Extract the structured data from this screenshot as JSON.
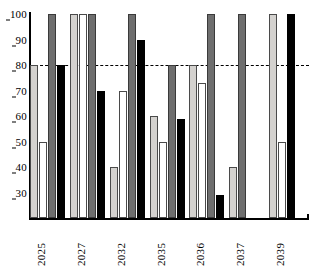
{
  "chart_data": {
    "type": "bar",
    "title": "",
    "xlabel": "",
    "ylabel": "",
    "ylim": [
      20,
      100
    ],
    "yticks": [
      20,
      30,
      40,
      50,
      60,
      70,
      80,
      90,
      100
    ],
    "grid": false,
    "legend": "none",
    "categories": [
      "2025",
      "2027",
      "2032",
      "2035",
      "2036",
      "2037",
      "2039"
    ],
    "series": [
      {
        "name": "series-1-light-gray",
        "color": "#d4d2cf",
        "values": [
          80,
          100,
          40,
          60,
          80,
          40,
          100
        ]
      },
      {
        "name": "series-2-white",
        "color": "#ffffff",
        "values": [
          50,
          100,
          70,
          50,
          73,
          null,
          50
        ]
      },
      {
        "name": "series-3-dark-gray",
        "color": "#6e6e6e",
        "values": [
          100,
          100,
          100,
          80,
          100,
          100,
          null
        ]
      },
      {
        "name": "series-4-black",
        "color": "#000000",
        "values": [
          80,
          70,
          90,
          59,
          29,
          null,
          100
        ]
      }
    ],
    "annotations": [
      {
        "type": "reference-line",
        "orientation": "horizontal",
        "value": 80,
        "style": "dashed",
        "color": "#000000"
      }
    ]
  }
}
